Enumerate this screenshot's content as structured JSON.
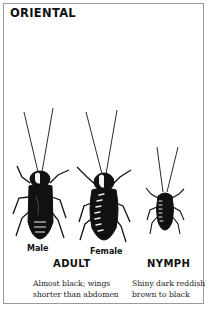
{
  "title": "ORIENTAL",
  "figures": [
    {
      "id": "male",
      "label": "Male",
      "icon": "male-adult-cockroach-icon"
    },
    {
      "id": "female",
      "label": "Female",
      "icon": "female-adult-cockroach-icon"
    },
    {
      "id": "nymph",
      "label": "",
      "icon": "nymph-cockroach-icon"
    }
  ],
  "groups": [
    {
      "label": "ADULT",
      "description": [
        "Almost black; wings",
        "shorter than abdomen"
      ]
    },
    {
      "label": "NYMPH",
      "description": [
        "Shiny dark reddish",
        "brown to black"
      ]
    }
  ],
  "colors": {
    "ink": "#111111",
    "border": "#9a9a9a",
    "background": "#ffffff"
  }
}
